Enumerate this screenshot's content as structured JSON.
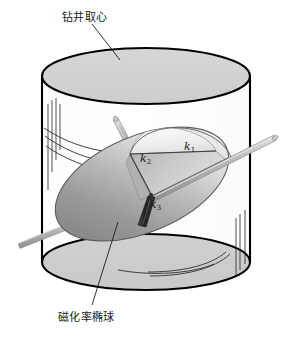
{
  "figure": {
    "name": "drill-core-magnetic-susceptibility-ellipsoid-diagram",
    "background_color": "#ffffff",
    "width": 292,
    "height": 339
  },
  "labels": {
    "core": "钻井取心",
    "ellipsoid": "磁化率椭球"
  },
  "axes": {
    "k1": "k",
    "k1_sub": "1",
    "k2": "k",
    "k2_sub": "2",
    "k3": "k",
    "k3_sub": "3"
  },
  "colors": {
    "outline": "#000000",
    "cylinder_top_fill": "#d2d2d2",
    "cylinder_body_fill": "#ffffff",
    "cylinder_bottom_fill": "#cfcfcf",
    "ellipsoid_dark": "#8f8f8f",
    "ellipsoid_light": "#f2f2f2",
    "rod_light": "#b9b9b9",
    "rod_dark": "#2a2a2a",
    "fracture_line": "#2b2b2b",
    "leader_line": "#1a1a1a"
  },
  "geometry": {
    "cylinder": {
      "center_x": 146,
      "top_ellipse_cy": 76,
      "bottom_ellipse_cy": 262,
      "rx": 104,
      "ry": 28
    },
    "ellipsoid": {
      "cx": 142,
      "cy": 184,
      "rx": 92,
      "ry": 48,
      "rotation_deg": -23
    }
  }
}
